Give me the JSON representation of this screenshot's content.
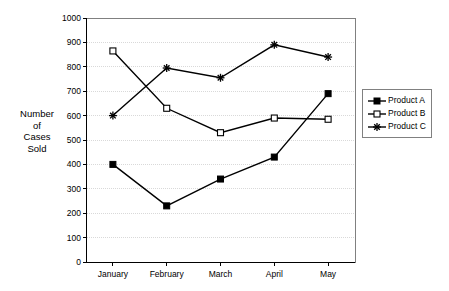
{
  "chart": {
    "type": "line",
    "background_color": "#FFFFFF",
    "plot_border_color": "#808080",
    "gridline_color": "#D9D9D9",
    "series_color": "#000000"
  },
  "chart_data": {
    "type": "line",
    "title": "",
    "xlabel": "",
    "ylabel": "Number\nof\nCases\nSold",
    "categories": [
      "January",
      "February",
      "March",
      "April",
      "May"
    ],
    "series": [
      {
        "name": "Product A",
        "marker": "filled-square",
        "values": [
          400,
          230,
          340,
          430,
          690
        ]
      },
      {
        "name": "Product B",
        "marker": "open-square",
        "values": [
          865,
          630,
          530,
          590,
          585
        ]
      },
      {
        "name": "Product C",
        "marker": "star",
        "values": [
          600,
          795,
          755,
          890,
          840
        ]
      }
    ],
    "ylim": [
      0,
      1000
    ],
    "y_ticks": [
      0,
      100,
      200,
      300,
      400,
      500,
      600,
      700,
      800,
      900,
      1000
    ],
    "y_tick_labels": [
      "0",
      "100",
      "200",
      "300",
      "400",
      "500",
      "600",
      "700",
      "800",
      "900",
      "1000"
    ],
    "grid": "horizontal",
    "legend_position": "right",
    "legend_entries": [
      "Product A",
      "Product B",
      "Product C"
    ]
  },
  "legend": {
    "items": [
      {
        "label": "Product A",
        "marker_name": "legend-marker-filled-square"
      },
      {
        "label": "Product B",
        "marker_name": "legend-marker-open-square"
      },
      {
        "label": "Product C",
        "marker_name": "legend-marker-star"
      }
    ]
  }
}
